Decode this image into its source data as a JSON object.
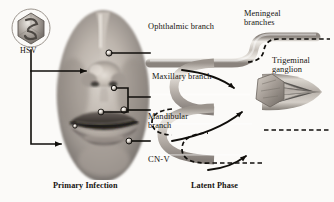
{
  "figure": {
    "width": 334,
    "height": 202,
    "background_color": "#fbfaf8",
    "ink_color": "#15120f"
  },
  "virus": {
    "label": "HSV",
    "icon_name": "hsv-virion-hexagon-icon",
    "shape": "hexagonal capsid in circle"
  },
  "panels": {
    "left": {
      "caption": "Primary Infection",
      "subject": "grayscale photograph of lower face with herpetic lesions"
    },
    "right": {
      "caption": "Latent Phase",
      "subject": "trigeminal nerve schematic with ganglion"
    }
  },
  "nerve_labels": [
    {
      "id": "ophthalmic",
      "line1": "Ophthalmic branch",
      "line2": ""
    },
    {
      "id": "meningeal",
      "line1": "Meningeal",
      "line2": "branches"
    },
    {
      "id": "maxillary",
      "line1": "Maxillary branch",
      "line2": ""
    },
    {
      "id": "ganglion",
      "line1": "Trigeminal",
      "line2": "ganglion"
    },
    {
      "id": "mandibular",
      "line1": "Mandibular",
      "line2": "branch"
    },
    {
      "id": "cnv",
      "line1": "CN-V",
      "line2": ""
    }
  ],
  "legend_paths": {
    "solid_arrow_meaning": "retrograde axonal transport toward ganglion",
    "dashed_line_meaning": "latent viral distribution along nerve branches"
  }
}
